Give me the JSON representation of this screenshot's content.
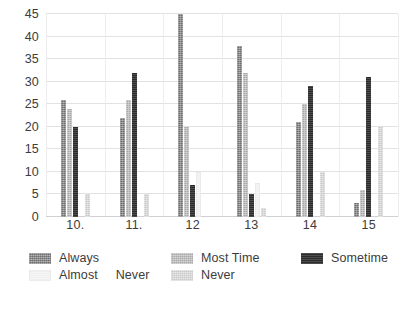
{
  "chart_data": {
    "type": "bar",
    "title": "",
    "subtitle": "",
    "xlabel": "",
    "ylabel": "",
    "ylim": [
      0,
      45
    ],
    "yticks": [
      0,
      5,
      10,
      15,
      20,
      25,
      30,
      35,
      40,
      45
    ],
    "ytick_labels": [
      "0",
      "5",
      "10",
      "15",
      "20",
      "25",
      "30",
      "35",
      "40",
      "45"
    ],
    "categories": [
      "10.",
      "11.",
      "12",
      "13",
      "14",
      "15"
    ],
    "grid": "horizontal-and-vertical",
    "legend_position": "bottom",
    "series": [
      {
        "name": "Always",
        "color": "#6e6e6e",
        "values": [
          26,
          22,
          45,
          38,
          21,
          3
        ]
      },
      {
        "name": "Most Time",
        "color": "#a8a8a8",
        "values": [
          24,
          26,
          20,
          32,
          25,
          6
        ]
      },
      {
        "name": "Sometime",
        "color": "#2b2b2b",
        "values": [
          20,
          32,
          7,
          5,
          29,
          31
        ]
      },
      {
        "name": "Almost  Never",
        "color": "#efefef",
        "values": [
          0,
          0,
          10,
          7.5,
          0,
          0
        ]
      },
      {
        "name": "Never",
        "color": "#c9c9c9",
        "values": [
          5,
          5,
          0,
          2,
          10,
          20
        ]
      }
    ]
  },
  "legend": {
    "row1": [
      {
        "label": "Always",
        "color": "#6e6e6e",
        "swatch_class": "s-always"
      },
      {
        "label": "Most Time",
        "color": "#a8a8a8",
        "swatch_class": "s-mosttime"
      },
      {
        "label": "Sometime",
        "color": "#2b2b2b",
        "swatch_class": "s-sometime"
      }
    ],
    "row2": [
      {
        "label": "Almost     Never",
        "color": "#efefef",
        "swatch_class": "s-almostnever"
      },
      {
        "label": "Never",
        "color": "#c9c9c9",
        "swatch_class": "s-never"
      }
    ]
  }
}
